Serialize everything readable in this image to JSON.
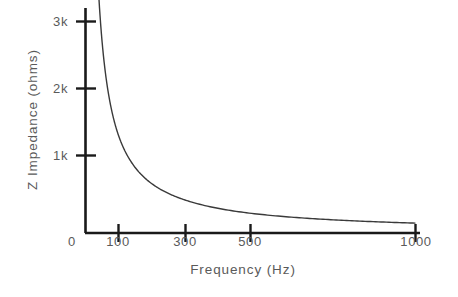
{
  "figure": {
    "background_color": "#ffffff",
    "axis_color": "#1a1a1a",
    "curve_color": "#3a3a3a",
    "text_color": "#5a5a5a"
  },
  "chart_data": {
    "type": "line",
    "title": "",
    "xlabel": "Frequency (Hz)",
    "ylabel": "Z Impedance (ohms)",
    "xtick_labels": [
      "0",
      "100",
      "300",
      "500",
      "1000"
    ],
    "xtick_values": [
      0,
      100,
      300,
      500,
      1000
    ],
    "ytick_labels": [
      "1k",
      "2k",
      "3k"
    ],
    "ytick_values": [
      1000,
      2000,
      3000
    ],
    "xlim": [
      0,
      1000
    ],
    "ylim": [
      0,
      3450
    ],
    "grid": false,
    "legend": null,
    "x_scale": "nonlinear-compressed",
    "series": [
      {
        "name": "Z Impedance",
        "x": [
          40,
          45,
          50,
          60,
          70,
          80,
          90,
          100,
          125,
          150,
          175,
          200,
          250,
          300,
          350,
          400,
          450,
          500,
          600,
          700,
          800,
          900,
          1000
        ],
        "values": [
          3450,
          3000,
          2700,
          2200,
          1870,
          1640,
          1450,
          1270,
          1030,
          880,
          770,
          690,
          570,
          640,
          560,
          510,
          480,
          450,
          410,
          380,
          355,
          335,
          310
        ]
      }
    ],
    "annotations": []
  },
  "axis_geometry": {
    "x_axis_pixel_positions": [
      85,
      118,
      185,
      250,
      415
    ],
    "y_axis_pixel_positions": {
      "zero": 233,
      "1k": 155,
      "2k": 88,
      "3k": 21
    }
  }
}
